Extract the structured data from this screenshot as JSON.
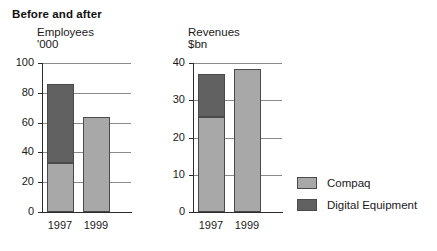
{
  "title": "Before and after",
  "legend": {
    "position": "right",
    "items": [
      {
        "label": "Compaq",
        "color": "#a8a8a8"
      },
      {
        "label": "Digital Equipment",
        "color": "#616161"
      }
    ]
  },
  "colors": {
    "compaq": "#a8a8a8",
    "digital_equipment": "#616161",
    "axis": "#2b2b2b",
    "gridline": "#8a8a8a",
    "background": "#ffffff",
    "text": "#1a1a1a"
  },
  "chart_data": [
    {
      "type": "bar",
      "subtype": "stacked",
      "title": "Employees",
      "subtitle": "'000",
      "xlabel": "",
      "ylabel": "Employees '000",
      "categories": [
        "1997",
        "1999"
      ],
      "ylim": [
        0,
        100
      ],
      "yticks": [
        0,
        20,
        40,
        60,
        80,
        100
      ],
      "ytick_labels": [
        "0",
        "20",
        "40",
        "60",
        "80",
        "100"
      ],
      "grid": true,
      "series": [
        {
          "name": "Compaq",
          "color": "#a8a8a8",
          "values": [
            33,
            64
          ]
        },
        {
          "name": "Digital Equipment",
          "color": "#616161",
          "values": [
            53,
            0
          ]
        }
      ],
      "totals": [
        86,
        64
      ]
    },
    {
      "type": "bar",
      "subtype": "stacked",
      "title": "Revenues",
      "subtitle": "$bn",
      "xlabel": "",
      "ylabel": "Revenues $bn",
      "categories": [
        "1997",
        "1999"
      ],
      "ylim": [
        0,
        40
      ],
      "yticks": [
        0,
        10,
        20,
        30,
        40
      ],
      "ytick_labels": [
        "0",
        "10",
        "20",
        "30",
        "40"
      ],
      "grid": true,
      "series": [
        {
          "name": "Compaq",
          "color": "#a8a8a8",
          "values": [
            25.5,
            38.5
          ]
        },
        {
          "name": "Digital Equipment",
          "color": "#616161",
          "values": [
            11.5,
            0
          ]
        }
      ],
      "totals": [
        37,
        38.5
      ]
    }
  ]
}
